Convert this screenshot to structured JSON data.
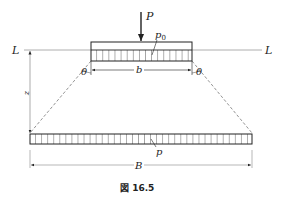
{
  "figure": {
    "caption": "図 16.5",
    "labels": {
      "load": "P",
      "contact_pressure": "p",
      "contact_pressure_sub": "0",
      "ground_line_left": "L",
      "ground_line_right": "L",
      "footing_width": "b",
      "spread_width": "B",
      "depth": "z",
      "spread_pressure": "p",
      "angle_left": "θ",
      "angle_right": "θ"
    },
    "colors": {
      "stroke": "#222222",
      "ground_line": "#999999",
      "dashed": "#777777"
    }
  }
}
